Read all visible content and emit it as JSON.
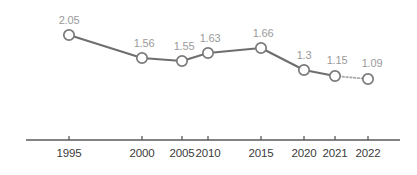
{
  "chart_data": {
    "type": "line",
    "title": "",
    "subtitle": "",
    "xlabel": "",
    "ylabel": "",
    "categories": [
      "1995",
      "2000",
      "2005",
      "2010",
      "2015",
      "2020",
      "2021",
      "2022"
    ],
    "values": [
      2.05,
      1.56,
      1.55,
      1.63,
      1.66,
      1.3,
      1.15,
      1.09
    ],
    "data_labels": [
      "2.05",
      "1.56",
      "1.55",
      "1.63",
      "1.66",
      "1.3",
      "1.15",
      "1.09"
    ],
    "series": [
      {
        "name": "",
        "values": [
          2.05,
          1.56,
          1.55,
          1.63,
          1.66,
          1.3,
          1.15,
          1.09
        ]
      }
    ],
    "projected_from_index": 6,
    "projected_segment_style": "dotted",
    "ylim": [
      0,
      2.3
    ],
    "grid": false,
    "legend": false,
    "legend_position": "none",
    "marker_style": "hollow-circle",
    "x_tick_labels": [
      "1995",
      "2000",
      "2005",
      "2010",
      "2015",
      "2020",
      "2021",
      "2022"
    ],
    "x_positions_px": [
      69,
      142,
      182,
      208,
      261,
      304,
      335,
      368
    ],
    "y_positions_px": [
      35,
      58,
      61,
      53,
      48,
      70,
      76,
      79
    ],
    "axis_y_px": 140,
    "axis_x_start_px": 26,
    "axis_x_end_px": 400
  },
  "colors": {
    "line": "#6e6e6e",
    "projected_line": "#a8a8a8",
    "marker_stroke": "#7a7a7a",
    "marker_fill": "#ffffff",
    "value_label": "#9a9a9a",
    "tick_label": "#3b3b3b",
    "axis": "#5a5a5a",
    "background": "#ffffff"
  }
}
